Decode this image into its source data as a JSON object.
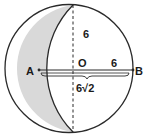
{
  "diagram": {
    "type": "geometry",
    "labels": {
      "point_a": "A",
      "point_b": "B",
      "center": "O",
      "radius_horizontal": "6",
      "radius_vertical": "6",
      "chord_length": "6√2"
    },
    "colors": {
      "stroke": "#2a2a2a",
      "shade": "#d9d9d9",
      "background": "#ffffff"
    }
  }
}
